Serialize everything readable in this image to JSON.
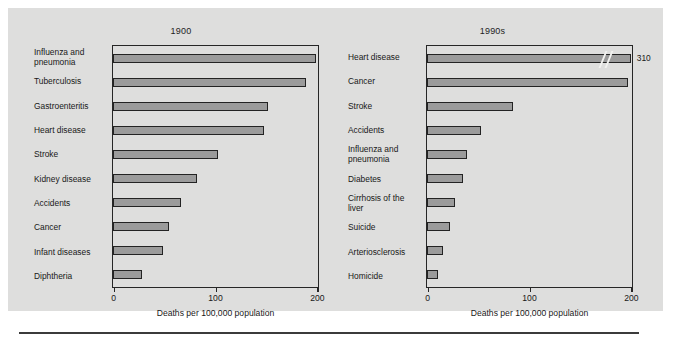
{
  "figure": {
    "axis_title": "Deaths per 100,000 population",
    "x_ticks": [
      "0",
      "100",
      "200"
    ],
    "bar_fill_color": "#9b9b9b",
    "bar_edge_color": "#232323",
    "panel_background": "#dededd"
  },
  "chart_data": [
    {
      "type": "bar",
      "orientation": "horizontal",
      "title": "1900",
      "xlabel": "Deaths per 100,000 population",
      "ylabel": "",
      "xlim": [
        0,
        200
      ],
      "xticks": [
        0,
        100,
        200
      ],
      "grid": false,
      "legend": "none",
      "categories": [
        "Influenza and\npneumonia",
        "Tuberculosis",
        "Gastroenteritis",
        "Heart disease",
        "Stroke",
        "Kidney disease",
        "Accidents",
        "Cancer",
        "Infant diseases",
        "Diphtheria"
      ],
      "values": [
        199,
        189,
        152,
        148,
        103,
        82,
        67,
        55,
        49,
        28
      ],
      "data_labels": [
        "",
        "",
        "",
        "",
        "",
        "",
        "",
        "",
        "",
        ""
      ],
      "axis_break": false
    },
    {
      "type": "bar",
      "orientation": "horizontal",
      "title": "1990s",
      "xlabel": "Deaths per 100,000 population",
      "ylabel": "",
      "xlim": [
        0,
        200
      ],
      "xticks": [
        0,
        100,
        200
      ],
      "grid": false,
      "legend": "none",
      "categories": [
        "Heart disease",
        "Cancer",
        "Stroke",
        "Accidents",
        "Influenza and\npneumonia",
        "Diabetes",
        "Cirrhosis of the\nliver",
        "Suicide",
        "Arteriosclerosis",
        "Homicide"
      ],
      "values": [
        310,
        197,
        84,
        53,
        39,
        35,
        27,
        23,
        16,
        11
      ],
      "data_labels": [
        "310",
        "",
        "",
        "",
        "",
        "",
        "",
        "",
        "",
        ""
      ],
      "axis_break": true,
      "axis_break_note": "Heart disease bar is truncated with a double-slash break mark; actual value 310 exceeds the 200 axis maximum."
    }
  ]
}
